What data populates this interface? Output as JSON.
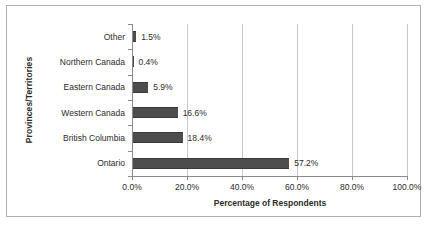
{
  "chart_data": {
    "type": "bar",
    "orientation": "horizontal",
    "title": "",
    "xlabel": "Percentage of Respondents",
    "ylabel": "Provinces/Territories",
    "categories": [
      "Other",
      "Northern Canada",
      "Eastern Canada",
      "Western Canada",
      "British Columbia",
      "Ontario"
    ],
    "values": [
      1.5,
      0.4,
      5.9,
      16.6,
      18.4,
      57.2
    ],
    "data_labels": [
      "1.5%",
      "0.4%",
      "5.9%",
      "16.6%",
      "18.4%",
      "57.2%"
    ],
    "xlim": [
      0,
      100
    ],
    "xticks": [
      0,
      20,
      40,
      60,
      80,
      100
    ],
    "xtick_labels": [
      "0.0%",
      "20.0%",
      "40.0%",
      "60.0%",
      "80.0%",
      "100.0%"
    ],
    "grid": "vertical",
    "legend": "none",
    "bar_color": "#4d4d4d",
    "gridline_color": "#c9c9c9",
    "axis_color": "#8a8a8a",
    "border_color": "#b0b0b0",
    "background_color": "#ffffff",
    "text_color": "#2b2b2b"
  }
}
